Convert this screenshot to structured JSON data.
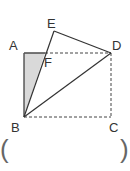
{
  "figure": {
    "type": "rectangle folded along diagonal BD",
    "points": {
      "A": {
        "label": "A",
        "x": 24,
        "y": 53
      },
      "B": {
        "label": "B",
        "x": 24,
        "y": 117
      },
      "C": {
        "label": "C",
        "x": 111,
        "y": 117
      },
      "D": {
        "label": "D",
        "x": 111,
        "y": 53
      },
      "E": {
        "label": "E",
        "x": 54,
        "y": 31
      },
      "F": {
        "label": "F",
        "x": 45,
        "y": 53
      }
    },
    "solid_segments": [
      "AB",
      "AF",
      "BE",
      "ED",
      "BD"
    ],
    "dashed_segments": [
      "FD",
      "DC",
      "BC"
    ],
    "shaded_region": "triangle ABF",
    "colors": {
      "line": "#333333",
      "dashed": "#444444",
      "shade": "#d9d9d9"
    }
  },
  "labels": {
    "A": "A",
    "B": "B",
    "C": "C",
    "D": "D",
    "E": "E",
    "F": "F"
  },
  "answer_blank": {
    "open": "(",
    "close": ")"
  }
}
